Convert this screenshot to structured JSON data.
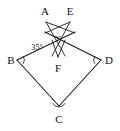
{
  "figure": {
    "type": "geometry-diagram",
    "background_color": "#ffffff",
    "stroke_color": "#1a1a1a",
    "width": 120,
    "height": 131,
    "points": [
      {
        "name": "A",
        "label": "A",
        "x": 46,
        "y": 22,
        "label_x": 45,
        "label_y": 14
      },
      {
        "name": "E",
        "label": "E",
        "x": 70,
        "y": 22,
        "label_x": 69,
        "label_y": 14
      },
      {
        "name": "B",
        "label": "B",
        "x": 17,
        "y": 60,
        "label_x": 10,
        "label_y": 63
      },
      {
        "name": "D",
        "label": "D",
        "x": 101,
        "y": 60,
        "label_x": 105,
        "label_y": 63
      },
      {
        "name": "C",
        "label": "C",
        "x": 59,
        "y": 106,
        "label_x": 56,
        "label_y": 120
      },
      {
        "name": "F",
        "label": "F",
        "x": 58,
        "y": 57,
        "label_x": 55,
        "label_y": 70
      }
    ],
    "segments": [
      {
        "name": "B-C",
        "from": "B",
        "to": "C"
      },
      {
        "name": "C-D",
        "from": "C",
        "to": "D"
      },
      {
        "name": "B-to-star-right",
        "from": [
          17,
          60
        ],
        "to": [
          74,
          33
        ]
      },
      {
        "name": "D-to-star-left",
        "from": [
          101,
          60
        ],
        "to": [
          46,
          33
        ]
      },
      {
        "name": "A-to-F-right",
        "from": [
          46,
          22
        ],
        "to": [
          64,
          55
        ]
      },
      {
        "name": "E-to-F-left",
        "from": [
          70,
          22
        ],
        "to": [
          53,
          55
        ]
      },
      {
        "name": "A-to-right-tip",
        "from": [
          46,
          22
        ],
        "to": [
          74,
          33
        ]
      },
      {
        "name": "E-to-left-tip",
        "from": [
          70,
          22
        ],
        "to": [
          46,
          33
        ]
      },
      {
        "name": "F-left-leg",
        "from": [
          58,
          57
        ],
        "to": [
          53,
          43
        ]
      },
      {
        "name": "F-right-leg",
        "from": [
          58,
          57
        ],
        "to": [
          64,
          43
        ]
      }
    ],
    "angle_marks": [
      {
        "name": "angle-at-B",
        "vertex": "B",
        "cx": 17,
        "cy": 60,
        "r": 7,
        "start_deg": -28,
        "end_deg": 34
      },
      {
        "name": "angle-at-D",
        "vertex": "D",
        "cx": 101,
        "cy": 60,
        "r": 7,
        "start_deg": 146,
        "end_deg": 208
      },
      {
        "name": "angle-at-C",
        "vertex": "C",
        "cx": 59,
        "cy": 106,
        "r": 7,
        "start_deg": 205,
        "end_deg": 335
      },
      {
        "name": "angle-35-mark",
        "vertex": "F-apex",
        "cx": 58,
        "cy": 40,
        "r": 5,
        "start_deg": 122,
        "end_deg": 230
      }
    ],
    "labels": {
      "angle_value": "35°",
      "angle_value_x": 37,
      "angle_value_y": 51
    }
  }
}
